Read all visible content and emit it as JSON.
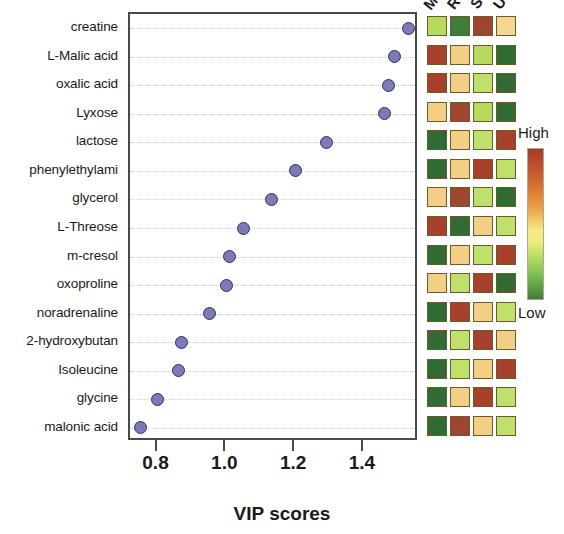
{
  "chart_data": {
    "type": "scatter",
    "title": "",
    "xlabel": "VIP scores",
    "ylabel": "",
    "xlim": [
      0.72,
      1.56
    ],
    "xticks": [
      "0.8",
      "1.0",
      "1.2",
      "1.4"
    ],
    "xtick_values": [
      0.8,
      1.0,
      1.2,
      1.4
    ],
    "grid": "horizontal-dotted",
    "point_color": "#7b7bb5",
    "point_edge_color": "#2f2f63",
    "categories": [
      "creatine",
      "L-Malic acid",
      "oxalic acid",
      "Lyxose",
      "lactose",
      "phenylethylami",
      "glycerol",
      "L-Threose",
      "m-cresol",
      "oxoproline",
      "noradrenaline",
      "2-hydroxybutan",
      "Isoleucine",
      "glycine",
      "malonic acid"
    ],
    "values": [
      1.53,
      1.49,
      1.47,
      1.46,
      1.29,
      1.2,
      1.13,
      1.05,
      1.01,
      1.0,
      0.95,
      0.87,
      0.86,
      0.8,
      0.75
    ],
    "heatmap": {
      "columns": [
        "M",
        "R",
        "S",
        "U"
      ],
      "legend": {
        "high_label": "High",
        "low_label": "Low"
      },
      "colors": [
        [
          "#b7d95c",
          "#3f7d3a",
          "#9e4630",
          "#f4d78f"
        ],
        [
          "#a8412c",
          "#f3cf86",
          "#b7d95c",
          "#2f6b33"
        ],
        [
          "#a8412c",
          "#f3cf86",
          "#bfe06a",
          "#2f6b33"
        ],
        [
          "#f3cf86",
          "#9e4630",
          "#b7d95c",
          "#2f6b33"
        ],
        [
          "#2f6b33",
          "#f3cf86",
          "#bfe06a",
          "#a8412c"
        ],
        [
          "#336b35",
          "#f3cf86",
          "#a8412c",
          "#bfe06a"
        ],
        [
          "#f3cf86",
          "#9e4630",
          "#bfe06a",
          "#2f6b33"
        ],
        [
          "#a8412c",
          "#336b35",
          "#f3cf86",
          "#bfe06a"
        ],
        [
          "#336b35",
          "#f3cf86",
          "#bfe06a",
          "#a8412c"
        ],
        [
          "#f3cf86",
          "#bfe06a",
          "#a8412c",
          "#2f6b33"
        ],
        [
          "#2f6b33",
          "#a8412c",
          "#f3cf86",
          "#bfe06a"
        ],
        [
          "#336b35",
          "#bfe06a",
          "#a8412c",
          "#f3cf86"
        ],
        [
          "#2f6b33",
          "#bfe06a",
          "#f3cf86",
          "#a8412c"
        ],
        [
          "#336b35",
          "#f3cf86",
          "#a8412c",
          "#bfe06a"
        ],
        [
          "#2f6b33",
          "#9e4630",
          "#f3cf86",
          "#bfe06a"
        ]
      ]
    }
  }
}
